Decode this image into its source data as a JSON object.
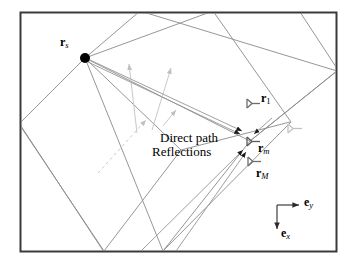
{
  "figure": {
    "kind": "image-source-method-room-acoustics-diagram",
    "background_color": "#ffffff",
    "frame": {
      "color": "#3a3a3a",
      "x": 20,
      "y": 12,
      "width": 317,
      "height": 240
    },
    "colors": {
      "room_line": "#8a8a8a",
      "ray_line": "#9a9a9a",
      "faint_ray": "#c8c8c8",
      "mic_icon": "#6e6e6e",
      "mic_icon_faint": "#bcbcbc",
      "source_dot": "#000000",
      "axis": "#2b2b2b",
      "text": "#000000"
    },
    "source": {
      "label_main": "r",
      "label_sub": "s",
      "dot_x": 85,
      "dot_y": 58,
      "dot_radius": 5
    },
    "receivers": [
      {
        "name": "receiver-1",
        "label_main": "r",
        "label_sub": "1",
        "sub_style": "upright",
        "x": 250,
        "y": 103
      },
      {
        "name": "receiver-m",
        "label_main": "r",
        "label_sub": "m",
        "sub_style": "italic",
        "x": 250,
        "y": 141
      },
      {
        "name": "receiver-M",
        "label_main": "r",
        "label_sub": "M",
        "sub_style": "italic",
        "x": 251,
        "y": 161
      },
      {
        "name": "receiver-extra",
        "label_main": "",
        "label_sub": "",
        "sub_style": "none",
        "x": 292,
        "y": 128
      }
    ],
    "annotations": {
      "direct_path": "Direct path",
      "reflections": "Reflections"
    },
    "axes": {
      "origin_x": 277,
      "origin_y": 205,
      "y_axis": {
        "label_main": "e",
        "label_sub": "y",
        "tip_x": 300,
        "tip_y": 205
      },
      "x_axis": {
        "label_main": "e",
        "label_sub": "x",
        "tip_x": 277,
        "tip_y": 230
      }
    },
    "rooms": [
      {
        "name": "room-primary",
        "points": "85,58 212,10 290,122 163,252"
      },
      {
        "name": "room-mirror-upper-right",
        "points": "85,58 138,12 337,70 250,141"
      },
      {
        "name": "room-mirror-left",
        "points": "85,58 20,124 103,252 180,150"
      },
      {
        "name": "room-mirror-lower",
        "points": "250,141 337,72 337,30 200,12"
      }
    ],
    "rays": [
      {
        "name": "ray-direct",
        "d": "M 88,61 L 243,137",
        "style": "solid"
      },
      {
        "name": "ray-reflect-1",
        "d": "M 88,62 L 240,134",
        "style": "solid"
      },
      {
        "name": "ray-reflect-2",
        "d": "M 140,252 L 245,146",
        "style": "solid"
      },
      {
        "name": "ray-reflect-3",
        "d": "M 175,252 L 247,149",
        "style": "solid"
      },
      {
        "name": "ray-faint-1",
        "d": "M 135,130 L 128,65",
        "style": "faint"
      },
      {
        "name": "ray-faint-2",
        "d": "M 150,128 L 170,68",
        "style": "faint"
      },
      {
        "name": "ray-faint-3",
        "d": "M 160,125 L 175,112",
        "style": "faint"
      },
      {
        "name": "ray-dashed-left",
        "d": "M 145,120 L 95,175",
        "style": "dashed"
      }
    ]
  }
}
